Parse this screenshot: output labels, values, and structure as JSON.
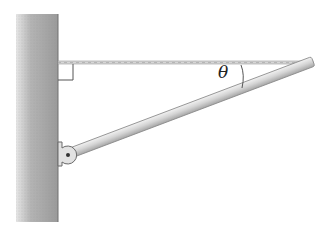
{
  "diagram": {
    "angle_label": "θ",
    "elements": [
      "wall",
      "horizontal-wire",
      "right-angle-marker",
      "boom",
      "hinge",
      "angle-arc"
    ],
    "colors": {
      "wall": "#a8a8a8",
      "boom": "#d0d0d0",
      "wire": "#b0b0b0"
    }
  }
}
